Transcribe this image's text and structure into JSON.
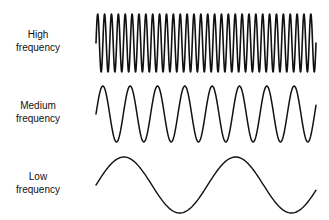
{
  "rows": [
    {
      "line1": "High",
      "line2": "frequency",
      "wave": {
        "x_start": 96,
        "x_end": 316,
        "midline_y": 43,
        "amplitude": 29,
        "cycles": 32,
        "stroke_width": 1.6
      }
    },
    {
      "line1": "Medium",
      "line2": "frequency",
      "wave": {
        "x_start": 96,
        "x_end": 316,
        "midline_y": 114,
        "amplitude": 28,
        "cycles": 8.05,
        "stroke_width": 1.5
      }
    },
    {
      "line1": "Low",
      "line2": "frequency",
      "wave": {
        "x_start": 96,
        "x_end": 316,
        "midline_y": 185,
        "amplitude": 28,
        "cycles": 1.97,
        "stroke_width": 1.4
      }
    }
  ],
  "colors": {
    "wave": "#111111",
    "text": "#111111",
    "background": "#ffffff"
  }
}
